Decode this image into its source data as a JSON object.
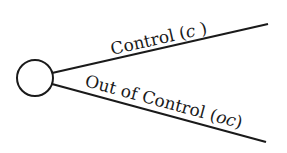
{
  "diagram": {
    "type": "decision-tree-chance-node",
    "node": {
      "shape": "circle",
      "label": ""
    },
    "branches": [
      {
        "id": "control",
        "label": "Control",
        "symbol": "c",
        "paren_open": "(",
        "paren_close": ")"
      },
      {
        "id": "out-of-control",
        "label": "Out of Control",
        "symbol": "oc",
        "paren_open": "(",
        "paren_close": ")"
      }
    ],
    "colors": {
      "stroke": "#1a1a1a",
      "background": "#ffffff"
    }
  }
}
